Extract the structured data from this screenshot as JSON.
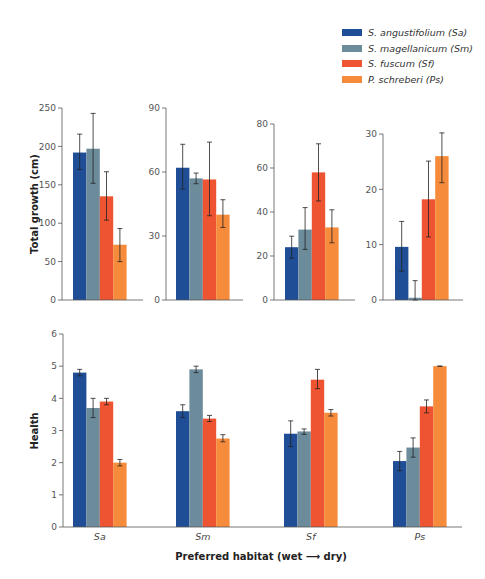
{
  "colors": {
    "Sa": "#1f4e96",
    "Sm": "#6c8b9b",
    "Sf": "#ee5431",
    "Ps": "#f68b3b",
    "axis": "#555555",
    "tick_text": "#555555",
    "error_bar": "#222222"
  },
  "legend": {
    "items": [
      {
        "key": "Sa",
        "label": "S. angustifolium (Sa)"
      },
      {
        "key": "Sm",
        "label": "S. magellanicum (Sm)"
      },
      {
        "key": "Sf",
        "label": "S. fuscum (Sf)"
      },
      {
        "key": "Ps",
        "label": "P. schreberi (Ps)"
      }
    ]
  },
  "chart_data": [
    {
      "type": "bar",
      "panel": "Total growth - Sa habitat",
      "title": "",
      "ylabel": "Total growth (cm)",
      "ylim": [
        0,
        250
      ],
      "yticks": [
        0,
        50,
        100,
        150,
        200,
        250
      ],
      "categories": [
        "Sa",
        "Sm",
        "Sf",
        "Ps"
      ],
      "values": [
        192,
        197,
        135,
        72
      ],
      "error_low": [
        170,
        152,
        104,
        50
      ],
      "error_high": [
        216,
        243,
        167,
        93
      ]
    },
    {
      "type": "bar",
      "panel": "Total growth - Sm habitat",
      "ylim": [
        0,
        90
      ],
      "yticks": [
        0,
        30,
        60,
        90
      ],
      "categories": [
        "Sa",
        "Sm",
        "Sf",
        "Ps"
      ],
      "values": [
        62,
        57,
        56.5,
        40
      ],
      "error_low": [
        52,
        54.5,
        39.5,
        34
      ],
      "error_high": [
        73,
        59.5,
        74,
        47
      ]
    },
    {
      "type": "bar",
      "panel": "Total growth - Sf habitat",
      "ylim": [
        0,
        80
      ],
      "yticks": [
        0,
        20,
        40,
        60,
        80
      ],
      "categories": [
        "Sa",
        "Sm",
        "Sf",
        "Ps"
      ],
      "values": [
        24,
        32,
        58,
        33
      ],
      "error_low": [
        19,
        23,
        45,
        26
      ],
      "error_high": [
        29,
        42,
        71,
        41
      ]
    },
    {
      "type": "bar",
      "panel": "Total growth - Ps habitat",
      "ylim": [
        0,
        30
      ],
      "yticks": [
        0,
        10,
        20,
        30
      ],
      "categories": [
        "Sa",
        "Sm",
        "Sf",
        "Ps"
      ],
      "values": [
        9.6,
        0.4,
        18.2,
        26
      ],
      "error_low": [
        5.2,
        0,
        11.4,
        21.2
      ],
      "error_high": [
        14.2,
        3.5,
        25.1,
        30.2
      ]
    },
    {
      "type": "bar",
      "panel": "Health",
      "ylabel": "Health",
      "xlabel": "Preferred habitat (wet ⟶ dry)",
      "ylim": [
        0,
        6
      ],
      "yticks": [
        0,
        1,
        2,
        3,
        4,
        5,
        6
      ],
      "categories": [
        "Sa",
        "Sm",
        "Sf",
        "Ps"
      ],
      "series": [
        {
          "name": "S. angustifolium (Sa)",
          "values": [
            4.8,
            3.6,
            2.9,
            2.05
          ],
          "error_low": [
            4.7,
            3.4,
            2.5,
            1.75
          ],
          "error_high": [
            4.9,
            3.8,
            3.3,
            2.35
          ]
        },
        {
          "name": "S. magellanicum (Sm)",
          "values": [
            3.7,
            4.9,
            2.97,
            2.47
          ],
          "error_low": [
            3.4,
            4.8,
            2.88,
            2.17
          ],
          "error_high": [
            4.0,
            5.0,
            3.05,
            2.77
          ]
        },
        {
          "name": "S. fuscum (Sf)",
          "values": [
            3.9,
            3.37,
            4.58,
            3.75
          ],
          "error_low": [
            3.8,
            3.28,
            4.3,
            3.55
          ],
          "error_high": [
            4.0,
            3.47,
            4.9,
            3.95
          ]
        },
        {
          "name": "P. schreberi (Ps)",
          "values": [
            2.0,
            2.75,
            3.55,
            5.0
          ],
          "error_low": [
            1.9,
            2.65,
            3.45,
            5.0
          ],
          "error_high": [
            2.1,
            2.87,
            3.65,
            5.0
          ]
        }
      ]
    }
  ],
  "labels": {
    "top_ylabel": "Total growth (cm)",
    "bottom_ylabel": "Health",
    "xlabel": "Preferred habitat (wet ⟶ dry)",
    "x_categories": [
      "Sa",
      "Sm",
      "Sf",
      "Ps"
    ]
  }
}
